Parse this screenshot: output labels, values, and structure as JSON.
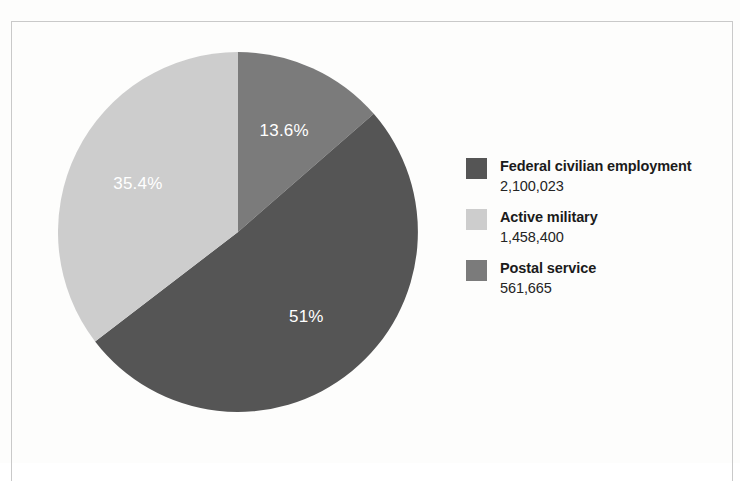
{
  "figure": {
    "frame_color": "#c9c9c9",
    "background": "#fdfdfc"
  },
  "chart_data": {
    "type": "pie",
    "title": "",
    "subtitle": "",
    "xlabel": "",
    "ylabel": "",
    "grid": false,
    "legend_position": "right",
    "start_angle_deg": 0,
    "direction": "clockwise",
    "categories": [
      "Postal service",
      "Federal civilian employment",
      "Active military"
    ],
    "values": [
      561665,
      2100023,
      1458400
    ],
    "percent_labels": [
      "13.6%",
      "51%",
      "35.4%"
    ],
    "percents": [
      13.6,
      51.0,
      35.4
    ],
    "colors": [
      "#7b7b7b",
      "#555555",
      "#cdcdcd"
    ],
    "label_text_color": "#ffffff",
    "slices": [
      {
        "name": "Postal service",
        "value": 561665,
        "value_text": "561,665",
        "percent": 13.6,
        "percent_text": "13.6%",
        "color": "#7b7b7b",
        "start_deg": 0,
        "end_deg": 48.96
      },
      {
        "name": "Federal civilian employment",
        "value": 2100023,
        "value_text": "2,100,023",
        "percent": 51.0,
        "percent_text": "51%",
        "color": "#555555",
        "start_deg": 48.96,
        "end_deg": 232.56
      },
      {
        "name": "Active military",
        "value": 1458400,
        "value_text": "1,458,400",
        "percent": 35.4,
        "percent_text": "35.4%",
        "color": "#cdcdcd",
        "start_deg": 232.56,
        "end_deg": 360
      }
    ]
  },
  "pie_labels": {
    "postal": "13.6%",
    "federal": "51%",
    "military": "35.4%"
  },
  "legend": {
    "items": [
      {
        "label": "Federal civilian employment",
        "value": "2,100,023",
        "color": "#555555",
        "swatch_name": "legend-swatch-federal-civilian-employment"
      },
      {
        "label": "Active military",
        "value": "1,458,400",
        "color": "#cdcdcd",
        "swatch_name": "legend-swatch-active-military"
      },
      {
        "label": "Postal service",
        "value": "561,665",
        "color": "#7b7b7b",
        "swatch_name": "legend-swatch-postal-service"
      }
    ]
  }
}
